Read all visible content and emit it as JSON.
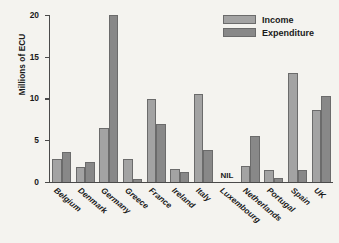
{
  "chart_data": {
    "type": "bar",
    "title": "",
    "xlabel": "",
    "ylabel": "Millions of ECU",
    "ylim": [
      0,
      20
    ],
    "yticks": [
      0,
      5,
      10,
      15,
      20
    ],
    "grid": false,
    "legend_position": "top-right",
    "categories": [
      "Belgium",
      "Denmark",
      "Germany",
      "Greece",
      "France",
      "Ireland",
      "Italy",
      "Luxembourg",
      "Netherlands",
      "Portugal",
      "Spain",
      "UK"
    ],
    "series": [
      {
        "name": "Income",
        "color": "#a3a3a3",
        "values": [
          2.8,
          1.8,
          6.5,
          2.8,
          10.0,
          1.6,
          10.6,
          0,
          1.9,
          1.4,
          13.0,
          8.6
        ]
      },
      {
        "name": "Expenditure",
        "color": "#888888",
        "values": [
          3.6,
          2.4,
          20.0,
          0.4,
          6.9,
          1.2,
          3.8,
          0,
          5.5,
          0.5,
          1.4,
          10.3
        ]
      }
    ],
    "annotations": [
      {
        "category": "Luxembourg",
        "text": "NIL"
      }
    ]
  },
  "legend": {
    "items": [
      {
        "label": "Income"
      },
      {
        "label": "Expenditure"
      }
    ]
  }
}
